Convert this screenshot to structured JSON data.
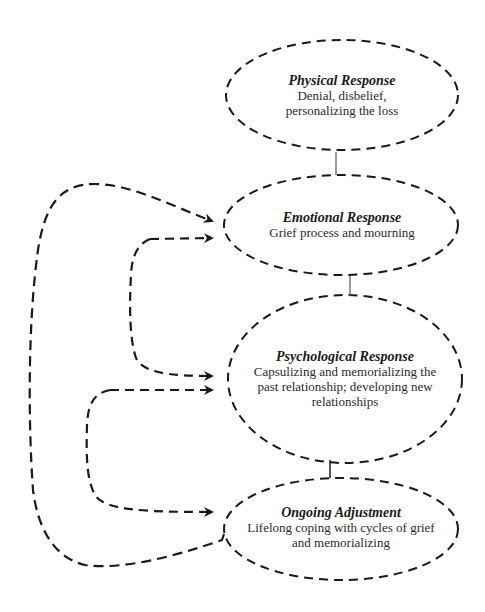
{
  "diagram": {
    "nodes": [
      {
        "id": "physical",
        "title": "Physical Response",
        "lines": [
          "Denial, disbelief,",
          "personalizing the loss"
        ]
      },
      {
        "id": "emotional",
        "title": "Emotional Response",
        "lines": [
          "Grief process and mourning"
        ]
      },
      {
        "id": "psychological",
        "title": "Psychological Response",
        "lines": [
          "Capsulizing and memorializing the",
          "past relationship; developing new",
          "relationships"
        ]
      },
      {
        "id": "ongoing",
        "title": "Ongoing Adjustment",
        "lines": [
          "Lifelong coping with cycles of grief",
          "and memorializing"
        ]
      }
    ],
    "edges": [
      {
        "from": "physical",
        "to": "emotional",
        "style": "solid-connector"
      },
      {
        "from": "emotional",
        "to": "psychological",
        "style": "solid-connector"
      },
      {
        "from": "psychological",
        "to": "ongoing",
        "style": "solid-connector"
      },
      {
        "from": "emotional",
        "to": "psychological",
        "style": "dashed-bracket-bidirectional-arrows"
      },
      {
        "from": "psychological",
        "to": "ongoing",
        "style": "dashed-bracket-bidirectional-arrows"
      },
      {
        "from": "ongoing",
        "to": "emotional",
        "style": "dashed-loop-arrow"
      }
    ],
    "colors": {
      "stroke": "#1a1a1a",
      "connector": "#555555",
      "background": "#ffffff"
    }
  }
}
